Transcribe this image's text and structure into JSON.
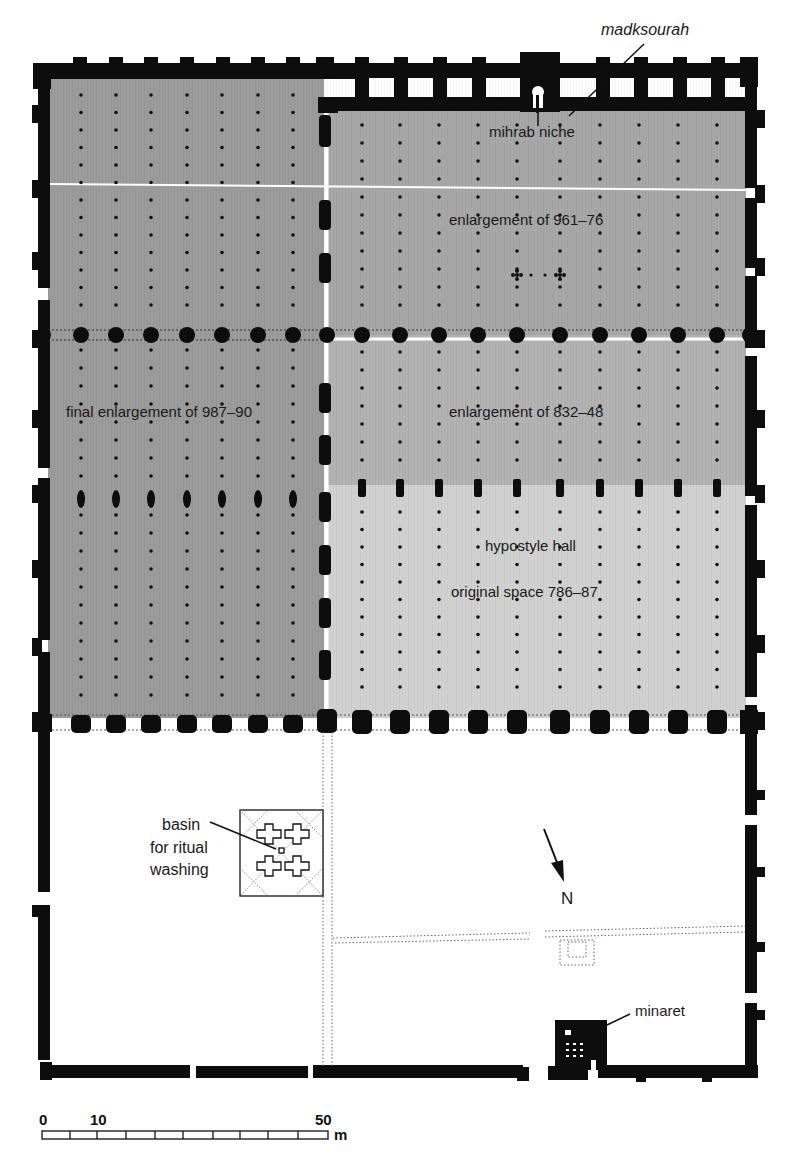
{
  "regions": [
    {
      "id": "final",
      "label": "final enlargement of 987–90",
      "color": "#9c9c9c"
    },
    {
      "id": "e961",
      "label": "enlargement of 961–76",
      "color": "#a8a8a8"
    },
    {
      "id": "e832",
      "label": "enlargement of 832–48",
      "color": "#b3b3b3"
    },
    {
      "id": "orig",
      "label_line1": "hypostyle hall",
      "label_line2": "original space 786–87",
      "color": "#d2d2d2"
    },
    {
      "id": "courtyard",
      "color": "#ffffff"
    }
  ],
  "labels": {
    "madksourah": "madksourah",
    "mihrab": "mihrab niche",
    "e961": "enlargement of 961–76",
    "final": "final enlargement of 987–90",
    "e832": "enlargement of 832–48",
    "hypostyle": "hypostyle hall",
    "original": "original space 786–87",
    "basin_1": "basin",
    "basin_2": "for ritual",
    "basin_3": "washing",
    "north": "N",
    "minaret": "minaret"
  },
  "scale": {
    "tick_0": "0",
    "tick_10": "10",
    "tick_50": "50",
    "unit": "m"
  },
  "colors": {
    "wall": "#0d0d0d",
    "column": "#111111",
    "divider": "#ffffff"
  }
}
